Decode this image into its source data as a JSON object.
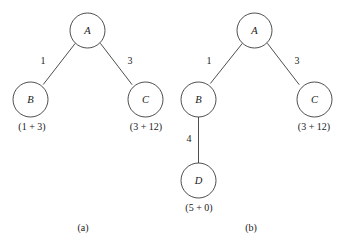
{
  "figure": {
    "background_color": "#ffffff",
    "stroke_color": "#3a3a3a",
    "text_color": "#1a1a1a",
    "panels": [
      {
        "caption": "(a)",
        "nodes": [
          {
            "id": "a-A",
            "label": "A",
            "annotation": ""
          },
          {
            "id": "a-B",
            "label": "B",
            "annotation": "(1 + 3)"
          },
          {
            "id": "a-C",
            "label": "C",
            "annotation": "(3 + 12)"
          }
        ],
        "edges": [
          {
            "id": "a-AB",
            "from": "A",
            "to": "B",
            "weight": "1"
          },
          {
            "id": "a-AC",
            "from": "A",
            "to": "C",
            "weight": "3"
          }
        ]
      },
      {
        "caption": "(b)",
        "nodes": [
          {
            "id": "b-A",
            "label": "A",
            "annotation": ""
          },
          {
            "id": "b-B",
            "label": "B",
            "annotation": ""
          },
          {
            "id": "b-C",
            "label": "C",
            "annotation": "(3 + 12)"
          },
          {
            "id": "b-D",
            "label": "D",
            "annotation": "(5 + 0)"
          }
        ],
        "edges": [
          {
            "id": "b-AB",
            "from": "A",
            "to": "B",
            "weight": "1"
          },
          {
            "id": "b-AC",
            "from": "A",
            "to": "C",
            "weight": "3"
          },
          {
            "id": "b-BD",
            "from": "B",
            "to": "D",
            "weight": "4"
          }
        ]
      }
    ]
  }
}
